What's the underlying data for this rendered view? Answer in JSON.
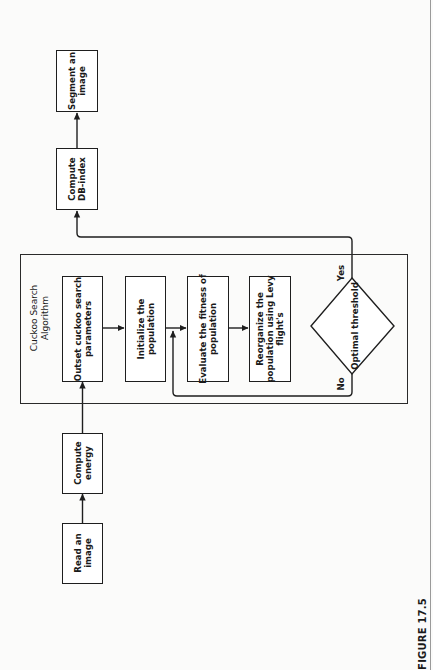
{
  "figure": {
    "caption": "FIGURE 17.5",
    "orientation": "rotated -90deg (landscape figure on portrait page)"
  },
  "nodes": {
    "read_image": {
      "lines": [
        "Read an",
        "image"
      ]
    },
    "compute_energy": {
      "lines": [
        "Compute",
        "energy"
      ]
    },
    "cuckoo_group": {
      "title_lines": [
        "Cuckoo Search",
        "Algorithm"
      ],
      "outset_params": {
        "lines": [
          "Outset cuckoo search",
          "parameters"
        ]
      },
      "initialize": {
        "lines": [
          "Initialize the",
          "population"
        ]
      },
      "evaluate": {
        "lines": [
          "Evaluate the fitness of",
          "population"
        ]
      },
      "reorganize": {
        "lines": [
          "Reorganize the",
          "population using Levy",
          "flight's"
        ]
      },
      "decision": {
        "label": "Optimal threshold",
        "yes_label": "Yes",
        "no_label": "No"
      }
    },
    "compute_db_index": {
      "lines": [
        "Compute",
        "DB-index"
      ]
    },
    "segment_image": {
      "lines": [
        "Segment an",
        "image"
      ]
    }
  },
  "edges": [
    {
      "from": "Read an image",
      "to": "Compute energy"
    },
    {
      "from": "Compute energy",
      "to": "Outset cuckoo search parameters"
    },
    {
      "from": "Outset cuckoo search parameters",
      "to": "Initialize the population"
    },
    {
      "from": "Initialize the population",
      "to": "Evaluate the fitness of population"
    },
    {
      "from": "Evaluate the fitness of population",
      "to": "Reorganize the population using Levy flight's"
    },
    {
      "from": "Optimal threshold",
      "to": "Evaluate the fitness of population",
      "label": "No"
    },
    {
      "from": "Optimal threshold",
      "to": "Compute DB-index",
      "label": "Yes"
    },
    {
      "from": "Compute DB-index",
      "to": "Segment an image"
    }
  ],
  "colors": {
    "line": "#1e1e1e",
    "background": "#fbfbfa"
  }
}
